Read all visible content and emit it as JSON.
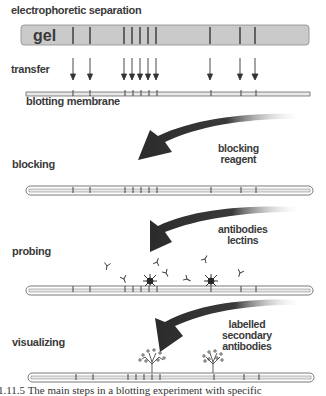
{
  "diagram": {
    "steps": [
      {
        "id": "separation",
        "label": "electrophoretic separation"
      },
      {
        "id": "transfer",
        "label": "transfer"
      },
      {
        "id": "blocking",
        "label": "blocking",
        "reagent": [
          "blocking",
          "reagent"
        ]
      },
      {
        "id": "probing",
        "label": "probing",
        "reagent": [
          "antibodies",
          "lectins"
        ]
      },
      {
        "id": "visualizing",
        "label": "visualizing",
        "reagent": [
          "labelled",
          "secondary",
          "antibodies"
        ]
      }
    ],
    "gel_label": "gel",
    "membrane_label": "blotting membrane",
    "band_positions_x": [
      73,
      90,
      124,
      132,
      140,
      148,
      156,
      210,
      240,
      255
    ],
    "colors": {
      "gel_fill": "#c8c8c8",
      "band": "#2a2a2a",
      "arrow_dark": "#2b2b2b",
      "membrane_fill": "#e6e6e6"
    },
    "caption": "1.11.5  The main steps in a blotting experiment with specific"
  }
}
